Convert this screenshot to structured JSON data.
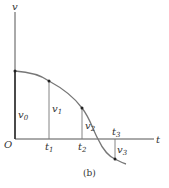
{
  "figure": {
    "caption": "(b)",
    "axes": {
      "y_label": "v",
      "x_label": "t",
      "origin_label": "O"
    },
    "velocity_labels": [
      {
        "base": "v",
        "sub": "0"
      },
      {
        "base": "v",
        "sub": "1"
      },
      {
        "base": "v",
        "sub": "2"
      },
      {
        "base": "v",
        "sub": "3"
      }
    ],
    "time_labels": [
      {
        "base": "t",
        "sub": "1"
      },
      {
        "base": "t",
        "sub": "2"
      },
      {
        "base": "t",
        "sub": "3"
      }
    ],
    "colors": {
      "line": "#555555",
      "curve": "#777777",
      "point": "#222222"
    }
  }
}
